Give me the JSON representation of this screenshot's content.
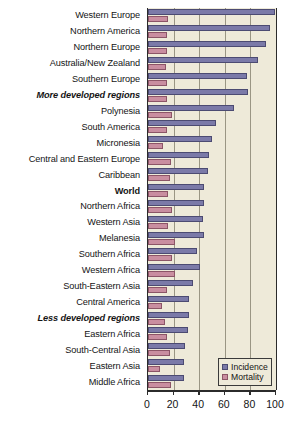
{
  "chart_data": {
    "type": "bar",
    "orientation": "horizontal",
    "title": "",
    "xlabel": "",
    "ylabel": "",
    "xlim": [
      0,
      100
    ],
    "xticks": [
      0,
      20,
      40,
      60,
      80,
      100
    ],
    "grid": true,
    "legend_position": "bottom-right",
    "categories": [
      "Western Europe",
      "Northern America",
      "Northern Europe",
      "Australia/New Zealand",
      "Southern Europe",
      "More developed regions",
      "Polynesia",
      "South America",
      "Micronesia",
      "Central and Eastern Europe",
      "Caribbean",
      "World",
      "Northern Africa",
      "Western Asia",
      "Melanesia",
      "Southern Africa",
      "Western Africa",
      "South-Eastern Asia",
      "Central America",
      "Less developed regions",
      "Eastern Africa",
      "South-Central Asia",
      "Eastern Asia",
      "Middle Africa"
    ],
    "emphasis": [
      false,
      false,
      false,
      false,
      false,
      "italic-bold",
      false,
      false,
      false,
      false,
      false,
      "bold",
      false,
      false,
      false,
      false,
      false,
      false,
      false,
      "italic-bold",
      false,
      false,
      false,
      false
    ],
    "series": [
      {
        "name": "Incidence",
        "color": "#7b7aa8",
        "values": [
          99,
          95,
          92,
          86,
          77,
          78,
          67,
          53,
          50,
          48,
          47,
          44,
          44,
          43,
          44,
          38,
          41,
          35,
          32,
          32,
          31,
          29,
          28,
          28
        ]
      },
      {
        "name": "Mortality",
        "color": "#c98ea0",
        "values": [
          16,
          15,
          15,
          14,
          15,
          15,
          19,
          15,
          12,
          18,
          17,
          16,
          19,
          16,
          21,
          19,
          21,
          15,
          11,
          13,
          15,
          17,
          9,
          18
        ]
      }
    ]
  },
  "legend": {
    "items": [
      {
        "label": "Incidence",
        "color": "#7b7aa8"
      },
      {
        "label": "Mortality",
        "color": "#c98ea0"
      }
    ]
  },
  "axis": {
    "tick_labels": [
      "0",
      "20",
      "40",
      "60",
      "80",
      "100"
    ]
  },
  "colors": {
    "plot_background": "#eeead9",
    "incidence": "#7b7aa8",
    "mortality": "#c98ea0",
    "gridline": "#9a9684",
    "axis": "#2b2b2b"
  }
}
